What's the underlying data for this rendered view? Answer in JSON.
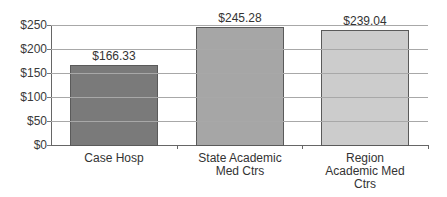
{
  "chart_data": {
    "type": "bar",
    "title": "",
    "xlabel": "",
    "ylabel": "",
    "categories": [
      "Case Hosp",
      "State Academic\nMed Ctrs",
      "Region\nAcademic Med\nCtrs"
    ],
    "values": [
      166.33,
      245.28,
      239.04
    ],
    "value_labels": [
      "$166.33",
      "$245.28",
      "$239.04"
    ],
    "bar_colors": [
      "#7a7a7a",
      "#a6a6a6",
      "#cccccc"
    ],
    "ylim": [
      0,
      250
    ],
    "yticks": [
      0,
      50,
      100,
      150,
      200,
      250
    ],
    "ytick_labels": [
      "$0",
      "$50",
      "$100",
      "$150",
      "$200",
      "$250"
    ],
    "grid": true,
    "legend": null
  }
}
